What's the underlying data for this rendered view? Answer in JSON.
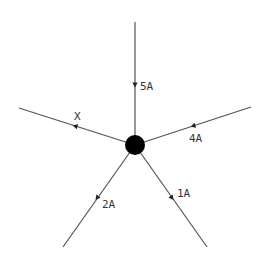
{
  "diagram": {
    "title": "",
    "node": {
      "cx": 135,
      "cy": 145,
      "r": 10,
      "color": "#000000"
    },
    "line_color": "#555555",
    "branches": [
      {
        "id": "top",
        "label": "5A",
        "x1": 135,
        "y1": 22,
        "x2": 135,
        "y2": 145,
        "arrow_x": 135,
        "arrow_y": 85,
        "arrow_dir": "toward-node",
        "label_x": 140,
        "label_y": 90
      },
      {
        "id": "left",
        "label": "X",
        "x1": 19,
        "y1": 108,
        "x2": 135,
        "y2": 145,
        "arrow_x": 75,
        "arrow_y": 126,
        "arrow_dir": "away-from-node",
        "label_x": 74,
        "label_y": 120
      },
      {
        "id": "right",
        "label": "4A",
        "x1": 251,
        "y1": 107,
        "x2": 135,
        "y2": 145,
        "arrow_x": 193,
        "arrow_y": 126,
        "arrow_dir": "toward-node",
        "label_x": 189,
        "label_y": 142
      },
      {
        "id": "lower-left",
        "label": "2A",
        "x1": 63,
        "y1": 247,
        "x2": 135,
        "y2": 145,
        "arrow_x": 97,
        "arrow_y": 198,
        "arrow_dir": "away-from-node",
        "label_x": 102,
        "label_y": 208
      },
      {
        "id": "lower-right",
        "label": "1A",
        "x1": 207,
        "y1": 247,
        "x2": 135,
        "y2": 145,
        "arrow_x": 172,
        "arrow_y": 198,
        "arrow_dir": "away-from-node",
        "label_x": 177,
        "label_y": 197
      }
    ]
  }
}
